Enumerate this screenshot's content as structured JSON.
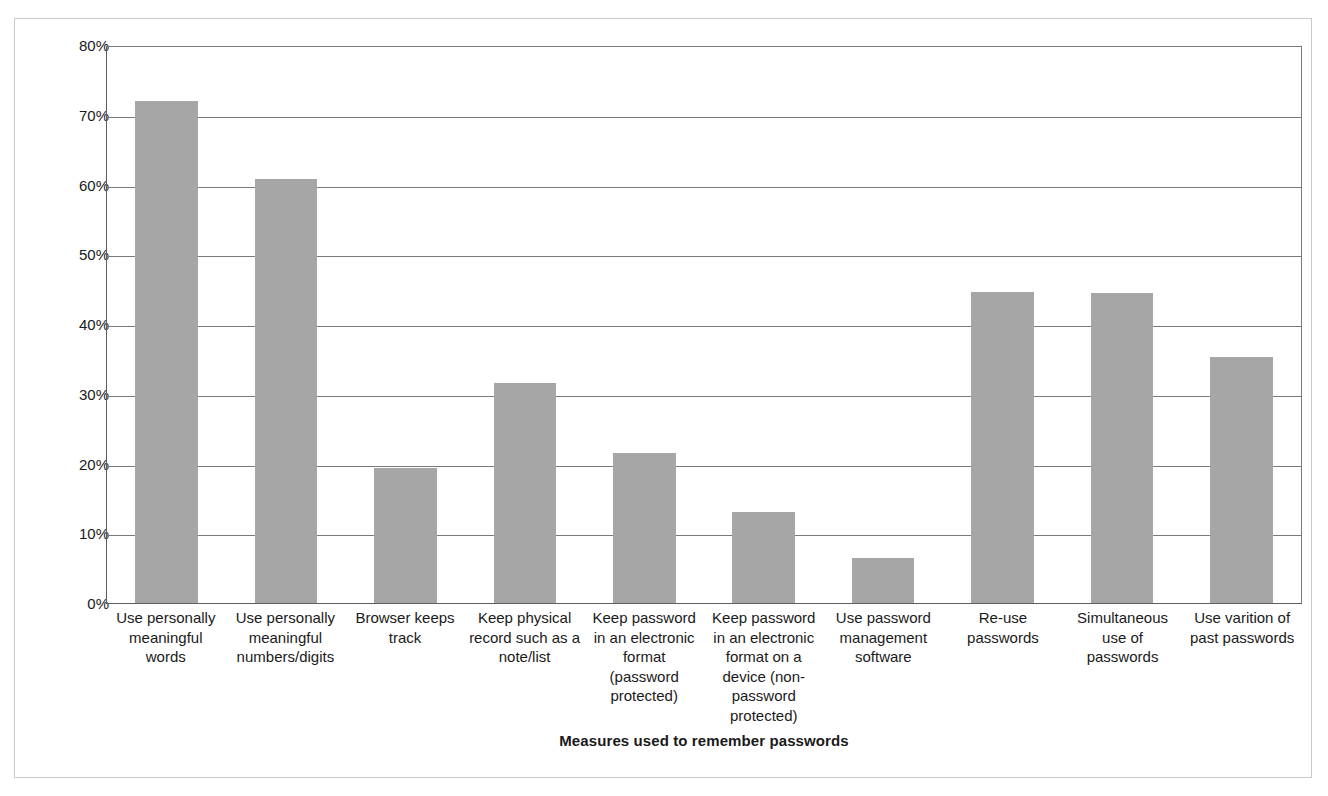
{
  "chart_data": {
    "type": "bar",
    "title": "",
    "xlabel": "Measures used to remember passwords",
    "ylabel": "Percentage",
    "ylim": [
      0,
      80
    ],
    "ytick_labels": [
      "80%",
      "70%",
      "60%",
      "50%",
      "40%",
      "30%",
      "20%",
      "10%",
      "0%"
    ],
    "ytick_values": [
      80,
      70,
      60,
      50,
      40,
      30,
      20,
      10,
      0
    ],
    "grid": true,
    "legend": "none",
    "bar_color": "#a6a6a6",
    "axis_color": "#5f5f5f",
    "categories": [
      "Use personally meaningful words",
      "Use personally meaningful numbers/digits",
      "Browser keeps track",
      "Keep physical record such as a note/list",
      "Keep password in an electronic format (password protected)",
      "Keep password in an electronic format on a device (non-password protected)",
      "Use password management software",
      "Re-use passwords",
      "Simultaneous use of passwords",
      "Use varition of past passwords"
    ],
    "values": [
      72.0,
      60.8,
      19.4,
      31.6,
      21.5,
      13.1,
      6.5,
      44.6,
      44.4,
      35.3
    ]
  }
}
